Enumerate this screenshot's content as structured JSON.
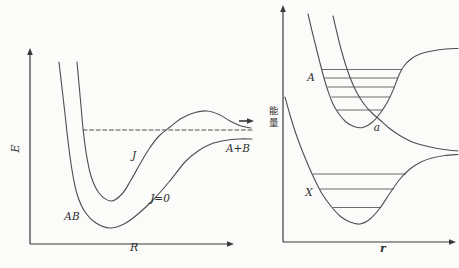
{
  "figure": {
    "background": "#fbfbf9",
    "line_color": "#4f4f4f",
    "axis_color": "#3a3a3a",
    "level_color": "#5a5a5a",
    "text_color": "#2f2f2f",
    "coords": "screen pixels, y increases downward"
  },
  "chart_data": [
    {
      "id": "left-panel",
      "type": "line",
      "title": "",
      "xlabel": "R",
      "ylabel": "E",
      "tick_labels": "none (qualitative potential sketch)",
      "axes": {
        "origin": [
          30,
          244
        ],
        "x_arrow": [
          234,
          244
        ],
        "y_arrow": [
          30,
          48
        ]
      },
      "series": [
        {
          "name": "potential-AB-J0",
          "label": "J=0",
          "style": "solid",
          "points": [
            [
              59,
              62
            ],
            [
              62,
              88
            ],
            [
              65,
              114
            ],
            [
              68,
              141
            ],
            [
              72,
              170
            ],
            [
              77,
              194
            ],
            [
              85,
              212
            ],
            [
              96,
              223
            ],
            [
              110,
              228
            ],
            [
              124,
              224
            ],
            [
              138,
              214
            ],
            [
              153,
              200
            ],
            [
              169,
              182
            ],
            [
              185,
              162
            ],
            [
              198,
              151
            ],
            [
              211,
              144
            ],
            [
              225,
              140.5
            ],
            [
              239,
              139
            ],
            [
              252,
              139
            ]
          ]
        },
        {
          "name": "effective-potential-J",
          "label": "J",
          "style": "solid",
          "points": [
            [
              77,
              62
            ],
            [
              79,
              84
            ],
            [
              81,
              106
            ],
            [
              83,
              128
            ],
            [
              86,
              152
            ],
            [
              91,
              176
            ],
            [
              99,
              193
            ],
            [
              111,
              201
            ],
            [
              122,
              194
            ],
            [
              131,
              180
            ],
            [
              140,
              164
            ],
            [
              149,
              149
            ],
            [
              159,
              136
            ],
            [
              170,
              127
            ],
            [
              182,
              118
            ],
            [
              195,
              112.5
            ],
            [
              207,
              111
            ],
            [
              219,
              114.5
            ],
            [
              230,
              121
            ],
            [
              241,
              126
            ],
            [
              251,
              128
            ]
          ]
        },
        {
          "name": "quasibound-level",
          "label": "",
          "style": "dashed",
          "points": [
            [
              83,
              130
            ],
            [
              252,
              130
            ]
          ]
        },
        {
          "name": "escape-arrow",
          "label": "",
          "style": "arrow",
          "points": [
            [
              239,
              121
            ],
            [
              254,
              121
            ]
          ]
        }
      ],
      "annotations": [
        {
          "text": "AB",
          "x": 72,
          "y": 217
        },
        {
          "text": "J",
          "x": 134,
          "y": 156
        },
        {
          "text": "J=0",
          "x": 160,
          "y": 199
        },
        {
          "text": "A+B",
          "x": 238,
          "y": 149
        }
      ]
    },
    {
      "id": "right-panel",
      "type": "line",
      "title": "",
      "xlabel": "r",
      "ylabel": "能量",
      "tick_labels": "none (qualitative potential sketch)",
      "axes": {
        "origin": [
          283,
          242
        ],
        "x_arrow": [
          456,
          242
        ],
        "y_arrow": [
          283,
          5
        ]
      },
      "series": [
        {
          "name": "excited-bound-state-A",
          "label": "A",
          "style": "solid",
          "points": [
            [
              308,
              14
            ],
            [
              312,
              31
            ],
            [
              316,
              47
            ],
            [
              320,
              63
            ],
            [
              324,
              78
            ],
            [
              328,
              91
            ],
            [
              333,
              104
            ],
            [
              339,
              114
            ],
            [
              346,
              122
            ],
            [
              354,
              126.5
            ],
            [
              363,
              127.5
            ],
            [
              372,
              122.5
            ],
            [
              380,
              113.5
            ],
            [
              388,
              101
            ],
            [
              394,
              88
            ],
            [
              399,
              75
            ],
            [
              404,
              66
            ],
            [
              411,
              59
            ],
            [
              420,
              54
            ],
            [
              432,
              51
            ],
            [
              446,
              49
            ],
            [
              458,
              48.5
            ]
          ]
        },
        {
          "name": "repulsive-state-a",
          "label": "a",
          "style": "solid",
          "points": [
            [
              333,
              16
            ],
            [
              337,
              33
            ],
            [
              341,
              49
            ],
            [
              346,
              66
            ],
            [
              351,
              80
            ],
            [
              357,
              93
            ],
            [
              364,
              104
            ],
            [
              372,
              113
            ],
            [
              380,
              120
            ],
            [
              389,
              128
            ],
            [
              399,
              135
            ],
            [
              410,
              141
            ],
            [
              422,
              145
            ],
            [
              435,
              148
            ],
            [
              448,
              150
            ],
            [
              458,
              151
            ]
          ]
        },
        {
          "name": "ground-state-X",
          "label": "X",
          "style": "solid",
          "points": [
            [
              285,
              97
            ],
            [
              290,
              115
            ],
            [
              295,
              131
            ],
            [
              300,
              145
            ],
            [
              306,
              160
            ],
            [
              313,
              176
            ],
            [
              321,
              192
            ],
            [
              330,
              205
            ],
            [
              340,
              216
            ],
            [
              350,
              222
            ],
            [
              360,
              224
            ],
            [
              370,
              219
            ],
            [
              380,
              208
            ],
            [
              390,
              193
            ],
            [
              400,
              179
            ],
            [
              410,
              169
            ],
            [
              421,
              162
            ],
            [
              432,
              158
            ],
            [
              445,
              155.5
            ],
            [
              458,
              154.5
            ]
          ]
        }
      ],
      "vibrational_levels": [
        {
          "state": "A",
          "y": 69.5,
          "x1": 322,
          "x2": 402
        },
        {
          "state": "A",
          "y": 78,
          "x1": 324.5,
          "x2": 398
        },
        {
          "state": "A",
          "y": 87,
          "x1": 327.5,
          "x2": 394
        },
        {
          "state": "A",
          "y": 97,
          "x1": 331.5,
          "x2": 390
        },
        {
          "state": "A",
          "y": 110,
          "x1": 337,
          "x2": 382.5
        },
        {
          "state": "X",
          "y": 174,
          "x1": 313,
          "x2": 406
        },
        {
          "state": "X",
          "y": 189,
          "x1": 320,
          "x2": 394
        },
        {
          "state": "X",
          "y": 207.5,
          "x1": 333,
          "x2": 380.5
        }
      ],
      "annotations": [
        {
          "text": "A",
          "x": 311,
          "y": 78
        },
        {
          "text": "a",
          "x": 377,
          "y": 128
        },
        {
          "text": "X",
          "x": 309,
          "y": 193
        }
      ]
    }
  ]
}
